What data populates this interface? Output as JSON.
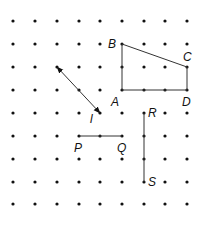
{
  "diagram": {
    "type": "dot-grid-geometry",
    "grid": {
      "columns_x": [
        13,
        35,
        57,
        79,
        100,
        122,
        144,
        165,
        187
      ],
      "rows_y": [
        21,
        44,
        67,
        90,
        113,
        136,
        159,
        182,
        204
      ],
      "dot_color": "#111111",
      "dot_radius": 1.6
    },
    "quadrilateral": {
      "vertices": [
        {
          "name": "A",
          "x": 122,
          "y": 90,
          "label": "A",
          "lx": 111,
          "ly": 106
        },
        {
          "name": "B",
          "x": 122,
          "y": 44,
          "label": "B",
          "lx": 108,
          "ly": 48
        },
        {
          "name": "C",
          "x": 187,
          "y": 67,
          "label": "C",
          "lx": 183,
          "ly": 61
        },
        {
          "name": "D",
          "x": 187,
          "y": 90,
          "label": "D",
          "lx": 182,
          "ly": 106
        }
      ]
    },
    "line_l": {
      "x1": 57,
      "y1": 67,
      "x2": 100,
      "y2": 113,
      "label": "l",
      "lx": 90,
      "ly": 123,
      "arrows": "both"
    },
    "segment_PQ": {
      "x1": 79,
      "y1": 136,
      "x2": 122,
      "y2": 136,
      "p_label": "P",
      "plx": 74,
      "ply": 152,
      "q_label": "Q",
      "qlx": 117,
      "qly": 152
    },
    "segment_RS": {
      "x1": 144,
      "y1": 113,
      "x2": 144,
      "y2": 182,
      "r_label": "R",
      "rlx": 148,
      "rly": 117,
      "s_label": "S",
      "slx": 148,
      "sly": 186
    },
    "line_color": "#333333"
  }
}
